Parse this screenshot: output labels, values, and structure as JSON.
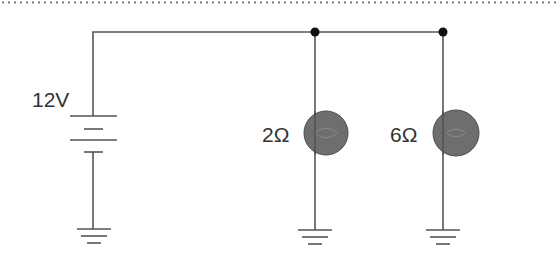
{
  "diagram": {
    "type": "circuit",
    "colors": {
      "wire": "#555555",
      "junction": "#111111",
      "bulb_fill": "#6e6e6e",
      "bulb_stroke": "#4a4a4a",
      "label": "#333333",
      "border_dots": "#777777"
    },
    "source": {
      "kind": "battery",
      "label": "12V"
    },
    "loads": [
      {
        "kind": "bulb",
        "label": "2Ω"
      },
      {
        "kind": "bulb",
        "label": "6Ω"
      }
    ],
    "junctions": 2,
    "grounds": 3,
    "connection": "parallel"
  }
}
